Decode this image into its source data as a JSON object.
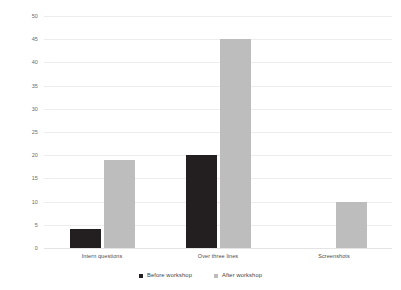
{
  "chart_data": {
    "type": "bar",
    "title": "",
    "subtitle": "",
    "xlabel": "",
    "ylabel": "",
    "categories": [
      "Intern questions",
      "Over three lines",
      "Screenshots"
    ],
    "series": [
      {
        "name": "Before workshop",
        "values": [
          4,
          20,
          0
        ],
        "color": "#231f20"
      },
      {
        "name": "After workshop",
        "values": [
          19,
          45,
          10
        ],
        "color": "#bdbdbd"
      }
    ],
    "ylim": [
      0,
      50
    ],
    "ytick_step": 5,
    "yticks": [
      0,
      5,
      10,
      15,
      20,
      25,
      30,
      35,
      40,
      45,
      50
    ],
    "ytick_labels": [
      "0",
      "5",
      "10",
      "15",
      "20",
      "25",
      "30",
      "35",
      "40",
      "45",
      "50"
    ],
    "grid": true,
    "grid_color": "#ededed",
    "legend_position": "bottom",
    "background": "#ffffff"
  },
  "legend": {
    "items": [
      {
        "label": "Before workshop",
        "swatch": "legend-swatch-before"
      },
      {
        "label": "After workshop",
        "swatch": "legend-swatch-after"
      }
    ]
  }
}
